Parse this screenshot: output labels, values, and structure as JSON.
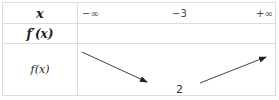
{
  "table": {
    "rows": {
      "x_label": "x",
      "fprime_label": "f′(x)",
      "f_label": "f(x)"
    },
    "x_values": [
      "−∞",
      "−3",
      "+∞"
    ],
    "f_values": {
      "min_value": "2",
      "variation": [
        "decreasing",
        "increasing"
      ]
    }
  }
}
